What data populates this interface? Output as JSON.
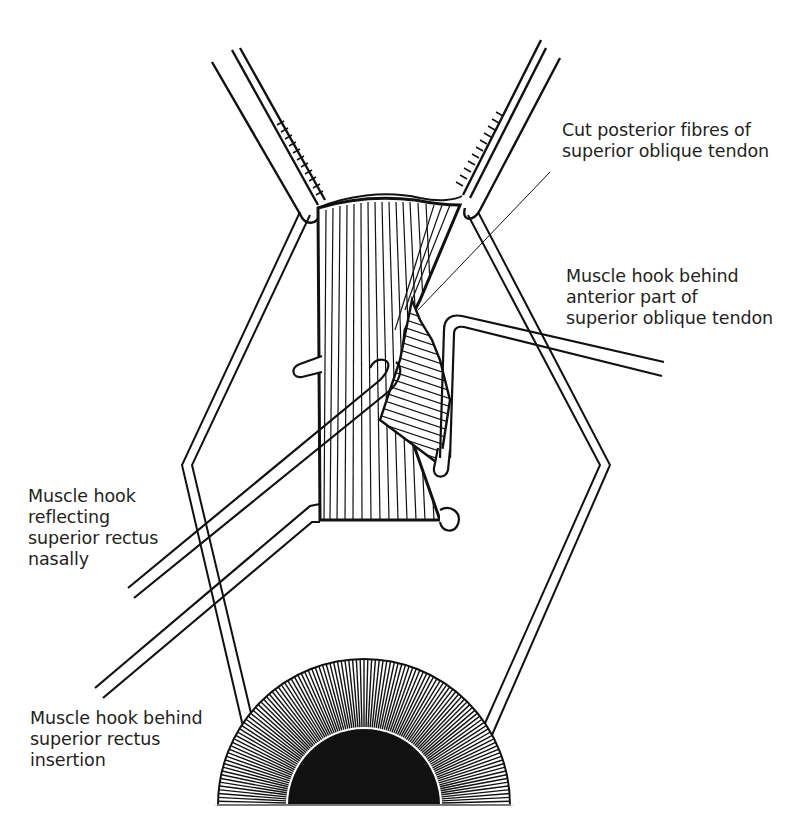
{
  "figure": {
    "type": "surgical illustration",
    "colors": {
      "ink": "#111111",
      "paper": "#ffffff",
      "text": "#231f20"
    }
  },
  "labels": {
    "cut_fibres": {
      "lines": [
        "Cut posterior fibres of",
        "superior oblique tendon"
      ]
    },
    "hook_anterior": {
      "lines": [
        "Muscle hook behind",
        "anterior part of",
        "superior oblique tendon"
      ]
    },
    "hook_reflecting": {
      "lines": [
        "Muscle hook",
        "reflecting",
        "superior rectus",
        "nasally"
      ]
    },
    "hook_insertion": {
      "lines": [
        "Muscle hook behind",
        "superior rectus",
        "insertion"
      ]
    }
  }
}
